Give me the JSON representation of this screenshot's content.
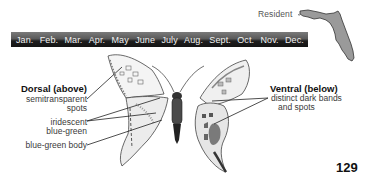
{
  "range": {
    "status_label": "Resident",
    "map_icon": "florida-map-icon",
    "map_fill": "#9a9a9a"
  },
  "flight_period": {
    "months": [
      "Jan.",
      "Feb.",
      "Mar.",
      "Apr.",
      "May",
      "June",
      "July",
      "Aug.",
      "Sept.",
      "Oct.",
      "Nov.",
      "Dec."
    ],
    "bar_color": "#1e1e1e"
  },
  "dorsal": {
    "heading": "Dorsal (above)",
    "labels": {
      "spots_line1": "semitransparent",
      "spots_line2": "spots",
      "iridescent_line1": "iridescent",
      "iridescent_line2": "blue-green",
      "body": "blue-green body"
    }
  },
  "ventral": {
    "heading": "Ventral (below)",
    "labels": {
      "bands_line1": "distinct dark bands",
      "bands_line2": "and spots"
    }
  },
  "page": {
    "number": "129"
  }
}
